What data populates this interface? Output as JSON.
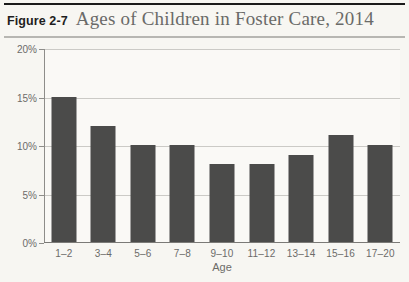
{
  "figure": {
    "label": "Figure 2-7",
    "title": "Ages of Children in Foster Care, 2014"
  },
  "chart_data": {
    "type": "bar",
    "title": "Ages of Children in Foster Care, 2014",
    "categories": [
      "1–2",
      "3–4",
      "5–6",
      "7–8",
      "9–10",
      "11–12",
      "13–14",
      "15–16",
      "17–20"
    ],
    "values": [
      15,
      12,
      10,
      10,
      8,
      8,
      9,
      11,
      10
    ],
    "xlabel": "Age",
    "ylabel": "",
    "ylim": [
      0,
      20
    ],
    "yticks": [
      20,
      15,
      10,
      5,
      0
    ],
    "ytick_labels": [
      "20%",
      "15%",
      "10%",
      "5%",
      "0%"
    ],
    "grid": true,
    "legend": false,
    "bar_color": "#4b4b4a",
    "gridline_color": "#cbcac6",
    "axis_color": "#8e8d8a",
    "text_color": "#6c6b69",
    "title_color": "#6a6a68"
  }
}
